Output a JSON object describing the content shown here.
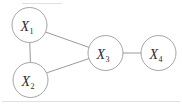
{
  "figure": {
    "background_color": "#ffffff",
    "node_fill": "#ffffff",
    "node_stroke": "#9a9a9a",
    "edge_color": "#8f8f8f",
    "frame_color": "#d8d8d8",
    "label_color": "#2b2b2b"
  },
  "graph": {
    "type": "undirected",
    "node_count": 4,
    "edge_count": 4,
    "nodes": [
      {
        "id": "X1",
        "symbol": "X",
        "subscript": "1",
        "label": "X1",
        "cx": 29.5,
        "cy": 25.0,
        "r": 17.5
      },
      {
        "id": "X2",
        "symbol": "X",
        "subscript": "2",
        "label": "X2",
        "cx": 30.5,
        "cy": 80.0,
        "r": 17.5
      },
      {
        "id": "X3",
        "symbol": "X",
        "subscript": "3",
        "label": "X3",
        "cx": 105.5,
        "cy": 53.0,
        "r": 17.5
      },
      {
        "id": "X4",
        "symbol": "X",
        "subscript": "4",
        "label": "X4",
        "cx": 158.5,
        "cy": 53.0,
        "r": 17.5
      }
    ],
    "edges": [
      {
        "id": "e1",
        "from": "X1",
        "to": "X2",
        "label": "X1-X2"
      },
      {
        "id": "e2",
        "from": "X1",
        "to": "X3",
        "label": "X1-X3"
      },
      {
        "id": "e3",
        "from": "X2",
        "to": "X3",
        "label": "X2-X3"
      },
      {
        "id": "e4",
        "from": "X3",
        "to": "X4",
        "label": "X3-X4"
      }
    ]
  },
  "labels": {
    "x1": "X",
    "x1_sub": "1",
    "x2": "X",
    "x2_sub": "2",
    "x3": "X",
    "x3_sub": "3",
    "x4": "X",
    "x4_sub": "4"
  }
}
